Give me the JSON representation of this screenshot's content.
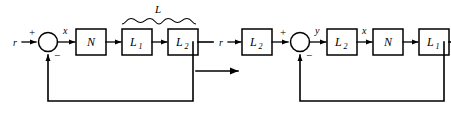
{
  "figure": {
    "ink_color": "#000000",
    "background_color": "#ffffff",
    "transform_arrow": "implies-arrow"
  },
  "left_diagram": {
    "name": "original-feedback-loop",
    "input_label": "r",
    "summing_junction": {
      "plus_sign": "+",
      "minus_sign": "−"
    },
    "signals": [
      {
        "name": "x",
        "label": "x"
      }
    ],
    "blocks": [
      {
        "name": "N",
        "label": "N",
        "subscript": ""
      },
      {
        "name": "L1",
        "label": "L",
        "subscript": "1"
      },
      {
        "name": "L2",
        "label": "L",
        "subscript": "2"
      }
    ],
    "brace": {
      "label": "L",
      "spans": [
        "L1",
        "L2"
      ]
    }
  },
  "right_diagram": {
    "name": "transformed-feedback-loop",
    "input_label": "r",
    "summing_junction": {
      "plus_sign": "+",
      "minus_sign": "−"
    },
    "signals": [
      {
        "name": "y",
        "label": "y"
      },
      {
        "name": "x",
        "label": "x"
      }
    ],
    "blocks": [
      {
        "name": "L2-prefilter",
        "label": "L",
        "subscript": "2"
      },
      {
        "name": "L2-forward",
        "label": "L",
        "subscript": "2"
      },
      {
        "name": "N",
        "label": "N",
        "subscript": ""
      },
      {
        "name": "L1",
        "label": "L",
        "subscript": "1"
      }
    ]
  }
}
